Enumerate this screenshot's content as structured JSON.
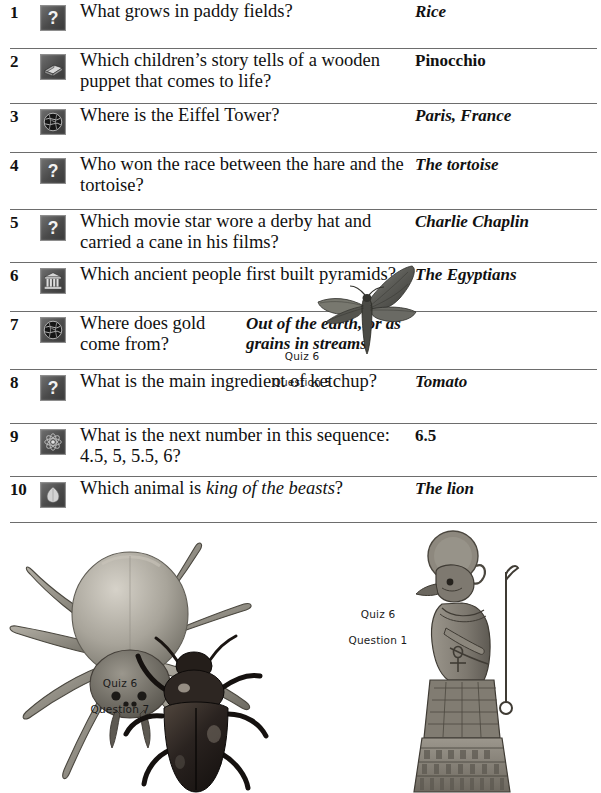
{
  "page": {
    "quiz_label": "Quiz 6",
    "rows": [
      {
        "number": "1",
        "icon": "question-mark-icon",
        "question": "What grows in paddy fields?",
        "answer": "Rice",
        "answer_style": "italic"
      },
      {
        "number": "2",
        "icon": "book-icon",
        "question": "Which children’s story tells of a wooden puppet that comes to life?",
        "answer": "Pinocchio",
        "answer_style": "upright"
      },
      {
        "number": "3",
        "icon": "globe-icon",
        "question": "Where is the Eiffel Tower?",
        "answer": "Paris, France",
        "answer_style": "italic"
      },
      {
        "number": "4",
        "icon": "question-mark-icon",
        "question": "Who won the race between the hare and the tortoise?",
        "answer": "The tortoise",
        "answer_style": "italic"
      },
      {
        "number": "5",
        "icon": "question-mark-icon",
        "question": "Which movie star wore a derby hat and carried a cane in his films?",
        "answer": "Charlie Chaplin",
        "answer_style": "italic"
      },
      {
        "number": "6",
        "icon": "temple-icon",
        "question": "Which ancient people first built pyramids?",
        "answer": "The Egyptians",
        "answer_style": "italic"
      },
      {
        "number": "7",
        "icon": "globe-icon",
        "question": "Where does gold come from?",
        "answer": "Out of the earth, or as grains in streams",
        "answer_style": "italic"
      },
      {
        "number": "8",
        "icon": "question-mark-icon",
        "question": "What is the main ingredient of ketchup?",
        "answer": "Tomato",
        "answer_style": "italic"
      },
      {
        "number": "9",
        "icon": "atom-icon",
        "question": "What is the next number in this sequence: 4.5, 5, 5.5, 6?",
        "answer": "6.5",
        "answer_style": "upright"
      },
      {
        "number": "10",
        "icon": "leaf-icon",
        "question_prefix": "Which animal is ",
        "question_emphasis": "king of the beasts",
        "question_suffix": "?",
        "question": "Which animal is king of the beasts?",
        "answer": "The lion",
        "answer_style": "italic"
      }
    ],
    "captions": [
      {
        "name": "moth-caption",
        "line1": "Quiz 6",
        "line2": "Question 5"
      },
      {
        "name": "spider-beetle-caption",
        "line1": "Quiz 6",
        "line2": "Question 7"
      },
      {
        "name": "egyptian-god-caption",
        "line1": "Quiz 6",
        "line2": "Question 1"
      }
    ],
    "illustrations": [
      {
        "name": "moth-illustration",
        "subject": "hawk moth"
      },
      {
        "name": "spider-illustration",
        "subject": "spider"
      },
      {
        "name": "beetle-illustration",
        "subject": "beetle"
      },
      {
        "name": "egyptian-god-illustration",
        "subject": "Egyptian sun god Ra seated on throne"
      }
    ],
    "colors": {
      "page_background": "#ffffff",
      "text": "#111111",
      "rule": "#6d6d6d",
      "icon_dark": "#3a3a3a",
      "icon_light": "#cfcfcf"
    }
  }
}
